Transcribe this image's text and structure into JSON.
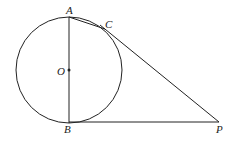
{
  "diagram": {
    "type": "geometry",
    "circle": {
      "center": "O",
      "cx": 69,
      "cy": 70,
      "r": 52
    },
    "points": {
      "A": {
        "label": "A",
        "x": 69,
        "y": 18
      },
      "B": {
        "label": "B",
        "x": 69,
        "y": 122
      },
      "C": {
        "label": "C",
        "x": 105,
        "y": 29
      },
      "O": {
        "label": "O",
        "x": 69,
        "y": 70
      },
      "P": {
        "label": "P",
        "x": 219,
        "y": 122
      }
    },
    "segments": [
      "AB",
      "AC",
      "CP",
      "BP"
    ],
    "colors": {
      "stroke": "#222222",
      "background": "#ffffff"
    }
  }
}
